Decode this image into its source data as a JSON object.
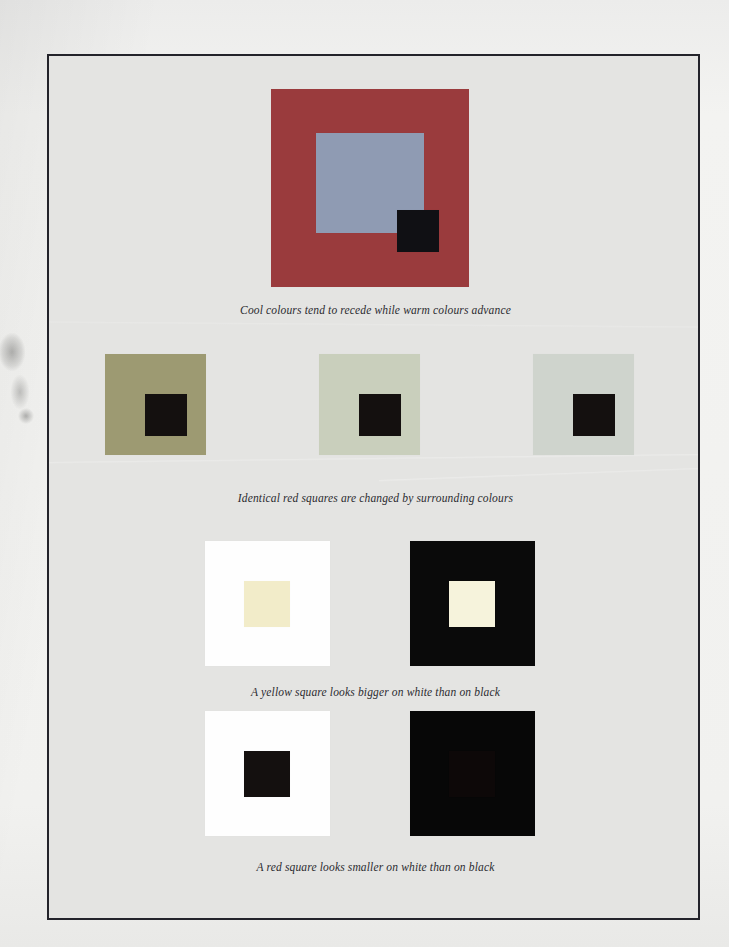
{
  "plate": {
    "title": "Colour perception demonstration plate",
    "background_colour": "#e4e4e2",
    "border_colour": "#23232a"
  },
  "figures": [
    {
      "id": "nested-squares",
      "caption": "Cool colours tend to recede while warm colours advance",
      "layers": [
        {
          "name": "outer-square",
          "colour": "#9a3b3d"
        },
        {
          "name": "middle-square",
          "colour": "#8f9bb3"
        },
        {
          "name": "inner-square",
          "colour": "#101014"
        }
      ]
    },
    {
      "id": "red-squares-on-surrounds",
      "caption": "Identical red squares are changed by surrounding colours",
      "panels": [
        {
          "name": "surround-olive",
          "surround_colour": "#9d9a72",
          "core_colour": "#14100f",
          "core_label": "red square"
        },
        {
          "name": "surround-pale-green",
          "surround_colour": "#c9cfbc",
          "core_colour": "#14100f",
          "core_label": "red square"
        },
        {
          "name": "surround-pale-blue",
          "surround_colour": "#cfd4cd",
          "core_colour": "#14100f",
          "core_label": "red square"
        }
      ]
    },
    {
      "id": "yellow-square-size",
      "caption": "A yellow square looks bigger on white than on black",
      "panels": [
        {
          "name": "yellow-on-white",
          "surround_colour": "#fefefe",
          "core_colour": "#f2ecc9"
        },
        {
          "name": "yellow-on-black",
          "surround_colour": "#0a0a0a",
          "core_colour": "#f6f3dc"
        }
      ]
    },
    {
      "id": "red-square-size",
      "caption": "A red square looks smaller on white than on black",
      "panels": [
        {
          "name": "red-on-white",
          "surround_colour": "#fefefe",
          "core_colour": "#14100f"
        },
        {
          "name": "red-on-black",
          "surround_colour": "#070707",
          "core_colour": "#0d0808"
        }
      ]
    }
  ]
}
